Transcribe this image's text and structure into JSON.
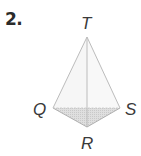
{
  "problem": {
    "number": "2."
  },
  "figure": {
    "type": "pyramid",
    "vertices": {
      "apex": "T",
      "left": "Q",
      "right": "S",
      "bottom": "R"
    },
    "colors": {
      "edge": "#bdbdbd",
      "face": "#f4f4f4",
      "base_shade": "#d6d6d6",
      "label": "#3a3a3a"
    }
  }
}
